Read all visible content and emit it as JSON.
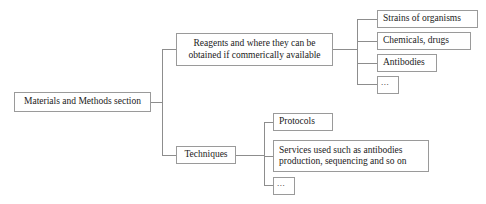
{
  "diagram": {
    "type": "tree",
    "colors": {
      "background": "#ffffff",
      "box_border": "#9a9a9a",
      "connector": "#8d8d8d",
      "text": "#1a1a1a"
    },
    "root": {
      "label": "Materials and Methods section"
    },
    "branches": [
      {
        "label": "Reagents and where they can be\nobtained if commerically available",
        "children": [
          {
            "label": "Strains of organisms"
          },
          {
            "label": "Chemicals, drugs"
          },
          {
            "label": "Antibodies"
          },
          {
            "label": "..."
          }
        ]
      },
      {
        "label": "Techniques",
        "children": [
          {
            "label": "Protocols"
          },
          {
            "label": "Services used such as antibodies\nproduction, sequencing and so on"
          },
          {
            "label": "..."
          }
        ]
      }
    ]
  }
}
